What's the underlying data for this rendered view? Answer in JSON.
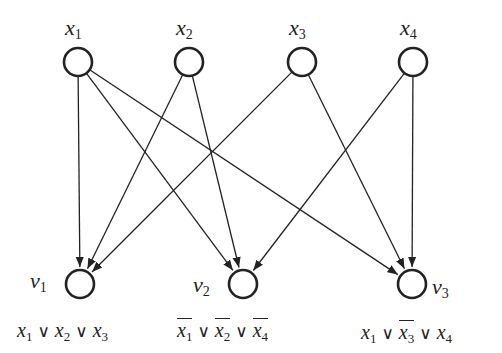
{
  "diagram": {
    "type": "bipartite-directed-graph",
    "stroke_color": "#222222",
    "background": "#ffffff",
    "variables": [
      {
        "id": "x1",
        "label": "x",
        "sub": "1",
        "cx": 78,
        "cy": 62
      },
      {
        "id": "x2",
        "label": "x",
        "sub": "2",
        "cx": 189,
        "cy": 62
      },
      {
        "id": "x3",
        "label": "x",
        "sub": "3",
        "cx": 302,
        "cy": 62
      },
      {
        "id": "x4",
        "label": "x",
        "sub": "4",
        "cx": 413,
        "cy": 62
      }
    ],
    "clauses": [
      {
        "id": "v1",
        "label": "v",
        "sub": "1",
        "cx": 80,
        "cy": 284,
        "formula": [
          {
            "var": "x",
            "sub": "1",
            "neg": false
          },
          {
            "var": "x",
            "sub": "2",
            "neg": false
          },
          {
            "var": "x",
            "sub": "3",
            "neg": false
          }
        ]
      },
      {
        "id": "v2",
        "label": "v",
        "sub": "2",
        "cx": 243,
        "cy": 284,
        "formula": [
          {
            "var": "x",
            "sub": "1",
            "neg": true
          },
          {
            "var": "x",
            "sub": "2",
            "neg": true
          },
          {
            "var": "x",
            "sub": "4",
            "neg": true
          }
        ]
      },
      {
        "id": "v3",
        "label": "v",
        "sub": "3",
        "cx": 412,
        "cy": 284,
        "formula": [
          {
            "var": "x",
            "sub": "1",
            "neg": false
          },
          {
            "var": "x",
            "sub": "3",
            "neg": true
          },
          {
            "var": "x",
            "sub": "4",
            "neg": false
          }
        ]
      }
    ],
    "edges": [
      [
        "x1",
        "v1"
      ],
      [
        "x1",
        "v2"
      ],
      [
        "x1",
        "v3"
      ],
      [
        "x2",
        "v1"
      ],
      [
        "x2",
        "v2"
      ],
      [
        "x3",
        "v1"
      ],
      [
        "x3",
        "v3"
      ],
      [
        "x4",
        "v2"
      ],
      [
        "x4",
        "v3"
      ]
    ],
    "or_symbol": "∨",
    "node_radius": 14
  }
}
